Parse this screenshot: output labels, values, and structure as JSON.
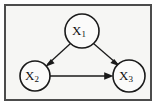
{
  "figure": {
    "type": "directed-acyclic-graph",
    "title": "",
    "caption": "",
    "background_color": "#f6f6f4",
    "frame_color": "#4c4c4c",
    "ink_color": "#1a1a1a",
    "node_fill": "#fbfbfa"
  },
  "graph": {
    "nodes": [
      {
        "id": "X1",
        "base": "X",
        "subscript": "1",
        "label": "X1",
        "cx": 82,
        "cy": 31,
        "r": 17
      },
      {
        "id": "X2",
        "base": "X",
        "subscript": "2",
        "label": "X2",
        "cx": 35,
        "cy": 76,
        "r": 15
      },
      {
        "id": "X3",
        "base": "X",
        "subscript": "3",
        "label": "X3",
        "cx": 129,
        "cy": 76,
        "r": 16
      }
    ],
    "edges": [
      {
        "id": "X1-X2",
        "from": "X1",
        "to": "X2",
        "label": "X1 -> X2",
        "directed": true,
        "style": "solid"
      },
      {
        "id": "X1-X3",
        "from": "X1",
        "to": "X3",
        "label": "X1 -> X3",
        "directed": true,
        "style": "solid"
      },
      {
        "id": "X2-X3",
        "from": "X2",
        "to": "X3",
        "label": "X2 -> X3",
        "directed": true,
        "style": "solid"
      }
    ]
  }
}
